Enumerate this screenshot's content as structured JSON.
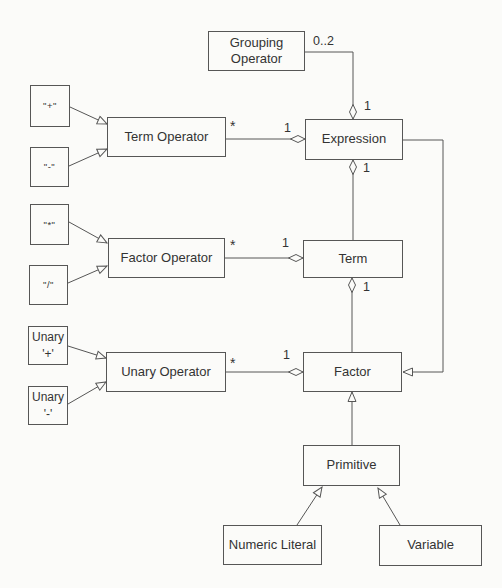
{
  "diagram": {
    "type": "uml-class-diagram",
    "nodes": {
      "grouping_operator": {
        "label": "Grouping Operator"
      },
      "expression": {
        "label": "Expression"
      },
      "term_operator": {
        "label": "Term Operator"
      },
      "plus": {
        "label": "\"+\""
      },
      "minus": {
        "label": "\"-\""
      },
      "times": {
        "label": "\"*\""
      },
      "divide": {
        "label": "\"/\""
      },
      "factor_operator": {
        "label": "Factor Operator"
      },
      "term": {
        "label": "Term"
      },
      "unary_operator": {
        "label": "Unary Operator"
      },
      "unary_plus": {
        "line1": "Unary",
        "line2": "'+'"
      },
      "unary_minus": {
        "line1": "Unary",
        "line2": "'-'"
      },
      "factor": {
        "label": "Factor"
      },
      "primitive": {
        "label": "Primitive"
      },
      "numeric_literal": {
        "label": "Numeric Literal"
      },
      "variable": {
        "label": "Variable"
      }
    },
    "edge_labels": {
      "grouping_expression_mult": "0..2",
      "grouping_expression_one": "1",
      "termop_expression_star": "*",
      "termop_expression_one": "1",
      "expression_term_one": "1",
      "factorop_term_star": "*",
      "factorop_term_one": "1",
      "term_factor_one": "1",
      "unaryop_factor_star": "*",
      "unaryop_factor_one": "1"
    },
    "relationships": [
      {
        "from": "Grouping Operator",
        "to": "Expression",
        "type": "aggregation",
        "part_multiplicity": "0..2",
        "whole_multiplicity": "1"
      },
      {
        "from": "Term Operator",
        "to": "Expression",
        "type": "aggregation",
        "part_multiplicity": "*",
        "whole_multiplicity": "1"
      },
      {
        "from": "Term",
        "to": "Expression",
        "type": "aggregation",
        "whole_multiplicity": "1"
      },
      {
        "from": "Factor Operator",
        "to": "Term",
        "type": "aggregation",
        "part_multiplicity": "*",
        "whole_multiplicity": "1"
      },
      {
        "from": "Factor",
        "to": "Term",
        "type": "aggregation",
        "whole_multiplicity": "1"
      },
      {
        "from": "Unary Operator",
        "to": "Factor",
        "type": "aggregation",
        "part_multiplicity": "*",
        "whole_multiplicity": "1"
      },
      {
        "from": "Expression",
        "to": "Factor",
        "type": "generalization"
      },
      {
        "from": "Primitive",
        "to": "Factor",
        "type": "generalization"
      },
      {
        "from": "Numeric Literal",
        "to": "Primitive",
        "type": "generalization"
      },
      {
        "from": "Variable",
        "to": "Primitive",
        "type": "generalization"
      },
      {
        "from": "\"+\"",
        "to": "Term Operator",
        "type": "generalization"
      },
      {
        "from": "\"-\"",
        "to": "Term Operator",
        "type": "generalization"
      },
      {
        "from": "\"*\"",
        "to": "Factor Operator",
        "type": "generalization"
      },
      {
        "from": "\"/\"",
        "to": "Factor Operator",
        "type": "generalization"
      },
      {
        "from": "Unary '+'",
        "to": "Unary Operator",
        "type": "generalization"
      },
      {
        "from": "Unary '-'",
        "to": "Unary Operator",
        "type": "generalization"
      }
    ],
    "colors": {
      "line": "#565656",
      "background": "#fbfbf9",
      "text": "#333333"
    }
  }
}
